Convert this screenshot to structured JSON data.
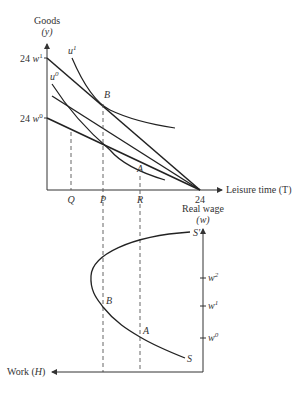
{
  "top_panel": {
    "y_axis_label": "Goods",
    "y_axis_symbol": "(y)",
    "x_axis_label": "Leisure time (T)",
    "x_axis_end_tick": "24",
    "y_intercepts": {
      "high": {
        "prefix": "24 ",
        "var": "w",
        "sup": "1"
      },
      "low": {
        "prefix": "24 ",
        "var": "w",
        "sup": "0"
      }
    },
    "curves": {
      "u1": {
        "var": "u",
        "sup": "1"
      },
      "u0": {
        "var": "u",
        "sup": "0"
      }
    },
    "points": {
      "B": "B",
      "A": "A"
    },
    "x_ticks": {
      "Q": "Q",
      "P": "P",
      "R": "R"
    }
  },
  "bottom_panel": {
    "y_axis_label": "Real wage",
    "y_axis_symbol": "(w)",
    "x_axis_label": "Work (H)",
    "wage_ticks": [
      {
        "var": "w",
        "sup": "2"
      },
      {
        "var": "w",
        "sup": "1"
      },
      {
        "var": "w",
        "sup": "0"
      }
    ],
    "curve_labels": {
      "S_prime": "S'",
      "S": "S"
    },
    "points": {
      "B": "B",
      "A": "A"
    }
  },
  "colors": {
    "line": "#222222",
    "axis": "#333333",
    "dashed": "#555555"
  }
}
